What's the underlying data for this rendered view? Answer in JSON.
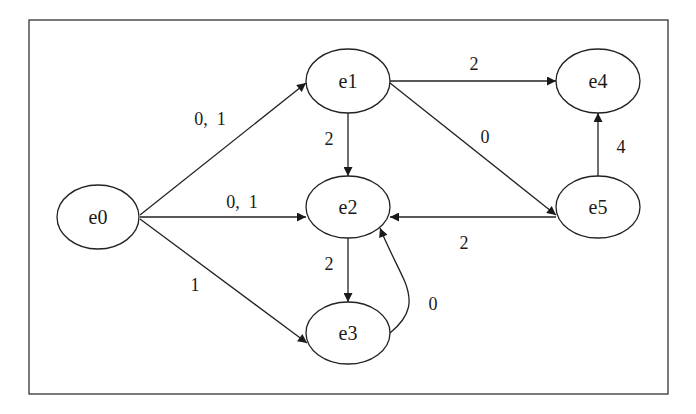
{
  "diagram": {
    "type": "directed-graph",
    "frame": {
      "x": 29,
      "y": 20,
      "width": 639,
      "height": 374
    },
    "nodes": [
      {
        "id": "e0",
        "label": "e0",
        "cx": 98,
        "cy": 217,
        "rx": 41,
        "ry": 32
      },
      {
        "id": "e1",
        "label": "e1",
        "cx": 348,
        "cy": 81,
        "rx": 42,
        "ry": 32
      },
      {
        "id": "e2",
        "label": "e2",
        "cx": 348,
        "cy": 207,
        "rx": 42,
        "ry": 31
      },
      {
        "id": "e3",
        "label": "e3",
        "cx": 348,
        "cy": 333,
        "rx": 42,
        "ry": 31
      },
      {
        "id": "e4",
        "label": "e4",
        "cx": 598,
        "cy": 81,
        "rx": 42,
        "ry": 32
      },
      {
        "id": "e5",
        "label": "e5",
        "cx": 598,
        "cy": 207,
        "rx": 42,
        "ry": 31
      }
    ],
    "edges": [
      {
        "from": "e0",
        "to": "e1",
        "label": "0,  1"
      },
      {
        "from": "e0",
        "to": "e2",
        "label": "0,  1"
      },
      {
        "from": "e0",
        "to": "e3",
        "label": "1"
      },
      {
        "from": "e1",
        "to": "e2",
        "label": "2"
      },
      {
        "from": "e1",
        "to": "e4",
        "label": "2"
      },
      {
        "from": "e1",
        "to": "e5",
        "label": "0"
      },
      {
        "from": "e2",
        "to": "e3",
        "label": "2"
      },
      {
        "from": "e3",
        "to": "e2",
        "label": "0"
      },
      {
        "from": "e5",
        "to": "e2",
        "label": "2"
      },
      {
        "from": "e5",
        "to": "e4",
        "label": "4"
      }
    ]
  }
}
